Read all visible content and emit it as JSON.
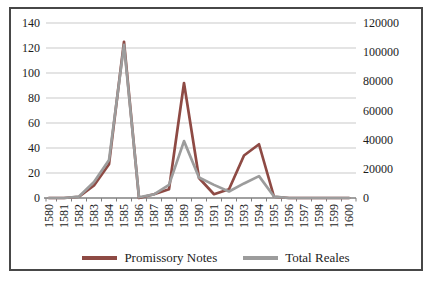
{
  "chart_data": {
    "type": "line",
    "title": "",
    "x": [
      "1580",
      "1581",
      "1582",
      "1583",
      "1584",
      "1585",
      "1586",
      "1587",
      "1588",
      "1589",
      "1590",
      "1591",
      "1592",
      "1593",
      "1594",
      "1595",
      "1596",
      "1597",
      "1598",
      "1599",
      "1600"
    ],
    "series": [
      {
        "name": "Promissory Notes",
        "axis": "left",
        "color": "#8E4A44",
        "values": [
          0,
          0,
          1,
          10,
          27,
          125,
          0,
          3,
          7,
          92,
          16,
          3,
          7,
          34,
          43,
          1,
          0,
          0,
          0,
          0,
          0
        ]
      },
      {
        "name": "Total Reales",
        "axis": "right",
        "color": "#9C9C9C",
        "values": [
          0,
          0,
          1000,
          11000,
          26000,
          105000,
          500,
          2500,
          9000,
          39000,
          14000,
          9000,
          4500,
          10000,
          15000,
          1000,
          0,
          0,
          0,
          0,
          0
        ]
      }
    ],
    "left_axis": {
      "min": 0,
      "max": 140,
      "step": 20,
      "tick_labels": [
        "0",
        "20",
        "40",
        "60",
        "80",
        "100",
        "120",
        "140"
      ]
    },
    "right_axis": {
      "min": 0,
      "max": 120000,
      "step": 20000,
      "tick_labels": [
        "0",
        "20000",
        "40000",
        "60000",
        "80000",
        "100000",
        "120000"
      ]
    },
    "grid": true,
    "legend_position": "bottom"
  },
  "colors": {
    "grid": "#C9C9C9",
    "axis": "#808080",
    "frame_border": "#474747",
    "text": "#1C1C1C",
    "background": "#FFFFFF"
  }
}
